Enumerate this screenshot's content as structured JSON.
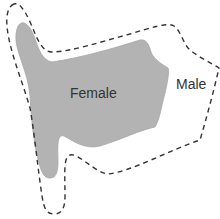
{
  "diagram": {
    "type": "region-diagram",
    "regions": [
      {
        "name": "Female",
        "label": "Female",
        "style": "filled",
        "fill_color": "#b3b3b3",
        "stroke_color": "#a6a6a6"
      },
      {
        "name": "Male",
        "label": "Male",
        "style": "dashed-outline",
        "stroke_color": "#333333"
      }
    ]
  },
  "colors": {
    "background": "#ffffff",
    "female_fill": "#b3b3b3",
    "male_stroke": "#333333",
    "text": "#333333"
  }
}
